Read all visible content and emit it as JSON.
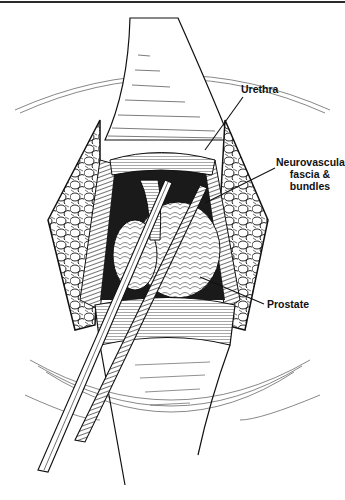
{
  "figure": {
    "type": "surgical-anatomical-illustration",
    "style": "black-and-white engraving line art",
    "colors": {
      "ink": "#111111",
      "paper": "#ffffff",
      "rule": "#2a2a2a"
    }
  },
  "labels": {
    "urethra": "Urethra",
    "neurovascular_line1": "Neurovascular",
    "neurovascular_line2": "fascia &",
    "neurovascular_line3": "bundles",
    "prostate": "Prostate"
  }
}
